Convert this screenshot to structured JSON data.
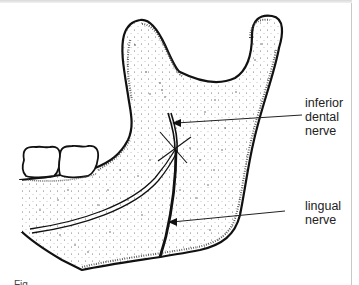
{
  "figure": {
    "labels": {
      "inferior_dental_nerve": {
        "line1": "inferior",
        "line2": "dental",
        "line3": "nerve"
      },
      "lingual_nerve": {
        "line1": "lingual",
        "line2": "nerve"
      }
    },
    "caption_fragment": "Fig. ",
    "colors": {
      "outline": "#111111",
      "stipple": "#333333",
      "text": "#222222",
      "background": "#ffffff"
    }
  }
}
